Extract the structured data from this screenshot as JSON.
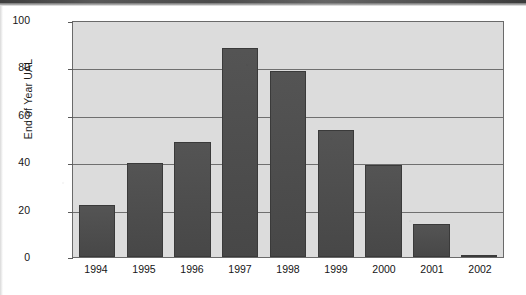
{
  "chart_data": {
    "type": "bar",
    "title": "",
    "xlabel": "",
    "ylabel": "End of Year UAL",
    "categories": [
      "1994",
      "1995",
      "1996",
      "1997",
      "1998",
      "1999",
      "2000",
      "2001",
      "2002"
    ],
    "values": [
      22,
      40,
      49,
      89,
      79,
      54,
      39,
      14,
      1
    ],
    "ylim": [
      0,
      100
    ],
    "yticks": [
      0,
      20,
      40,
      60,
      80,
      100
    ],
    "ytick_labels": [
      "0",
      "20",
      "40",
      "60",
      "80",
      "100"
    ],
    "grid": "horizontal",
    "legend": "none",
    "bar_color": "#4b4b4b",
    "plot_background": "#dcdcdc",
    "axis_color": "#6a6a6a",
    "page_background": "#ffffff"
  },
  "figure": {
    "y_axis_title": "End of Year UAL"
  }
}
